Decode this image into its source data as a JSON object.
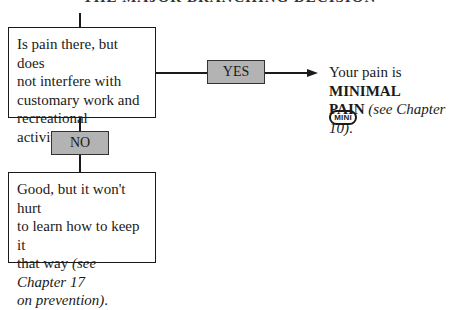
{
  "header": {
    "title": "THE MAJOR BRANCHING DECISION"
  },
  "question_box": {
    "lines": [
      "Is pain there, but does",
      "not interfere with",
      "customary work and",
      "recreational activities?"
    ]
  },
  "yes_label": "YES",
  "no_label": "NO",
  "yes_result": {
    "prefix": "Your pain is ",
    "bold1": "MINIMAL",
    "bold2": "PAIN",
    "italic": "(see Chapter 10)",
    "suffix": "."
  },
  "badge": {
    "label": "MINI"
  },
  "no_result": {
    "line1": "Good, but it won't hurt",
    "line2": "to learn how to keep it",
    "line3_plain": "that way ",
    "line3_italic": "(see Chapter 17",
    "line4_italic": "on prevention)",
    "line4_suffix": "."
  },
  "colors": {
    "label_fill": "#b3b3b3",
    "line": "#1a1a1a",
    "background": "#ffffff"
  }
}
